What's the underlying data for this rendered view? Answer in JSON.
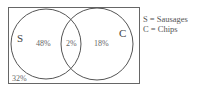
{
  "diagram": {
    "type": "venn",
    "sets": [
      {
        "id": "S",
        "label": "S"
      },
      {
        "id": "C",
        "label": "C"
      }
    ],
    "regions": {
      "only_S": "48%",
      "intersection": "2%",
      "only_C": "18%",
      "outside": "32%"
    },
    "legend": [
      "S = Sausages",
      "C = Chips"
    ],
    "colors": {
      "stroke": "#555555",
      "background": "#ffffff"
    }
  }
}
